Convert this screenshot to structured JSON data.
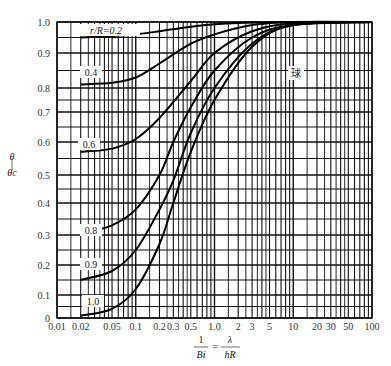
{
  "chart_data": {
    "type": "line",
    "title": "",
    "xlabel": "1/Bi = λ/(hR)",
    "xlabel_parts": {
      "left_num": "1",
      "left_den": "Bi",
      "eq": "=",
      "right_num": "λ",
      "right_den": "hR"
    },
    "ylabel": "θ/θc",
    "ylabel_parts": {
      "num": "θ",
      "den": "θc"
    },
    "xscale": "log",
    "xlim": [
      0.01,
      100
    ],
    "ylim": [
      0,
      1.0
    ],
    "grid": true,
    "x_tick_labels": [
      "0.01",
      "0.02",
      "0.05",
      "0.1",
      "0.2",
      "0.3",
      "0.5",
      "1.0",
      "2",
      "3",
      "5",
      "10",
      "20",
      "30",
      "50",
      "100"
    ],
    "x_ticks": [
      0.01,
      0.02,
      0.05,
      0.1,
      0.2,
      0.3,
      0.5,
      1.0,
      2,
      3,
      5,
      10,
      20,
      30,
      50,
      100
    ],
    "y_tick_labels": [
      "0",
      "0.1",
      "0.2",
      "0.3",
      "0.4",
      "0.5",
      "0.6",
      "0.7",
      "0.8",
      "0.9",
      "1.0"
    ],
    "y_ticks": [
      0,
      0.1,
      0.2,
      0.3,
      0.4,
      0.5,
      0.6,
      0.7,
      0.8,
      0.9,
      1.0
    ],
    "annotation": "球",
    "legend_prefix": "r/R=",
    "series": [
      {
        "name": "0.2",
        "label": "r/R=0.2",
        "x": [
          0.02,
          0.05,
          0.1,
          0.2,
          0.5,
          1,
          2,
          5,
          10
        ],
        "y": [
          0.95,
          0.955,
          0.96,
          0.97,
          0.985,
          0.993,
          0.997,
          0.999,
          1.0
        ]
      },
      {
        "name": "0.4",
        "label": "0.4",
        "x": [
          0.02,
          0.05,
          0.1,
          0.2,
          0.5,
          1,
          3,
          10
        ],
        "y": [
          0.81,
          0.815,
          0.83,
          0.87,
          0.93,
          0.96,
          0.99,
          1.0
        ]
      },
      {
        "name": "0.6",
        "label": "0.6",
        "x": [
          0.02,
          0.05,
          0.1,
          0.2,
          0.5,
          1,
          3,
          10
        ],
        "y": [
          0.57,
          0.58,
          0.61,
          0.68,
          0.82,
          0.9,
          0.97,
          0.995
        ]
      },
      {
        "name": "0.8",
        "label": "0.8",
        "x": [
          0.025,
          0.05,
          0.1,
          0.2,
          0.3,
          0.5,
          1,
          3,
          10
        ],
        "y": [
          0.31,
          0.33,
          0.38,
          0.5,
          0.6,
          0.72,
          0.85,
          0.95,
          0.99
        ]
      },
      {
        "name": "0.9",
        "label": "0.9",
        "x": [
          0.02,
          0.05,
          0.1,
          0.2,
          0.3,
          0.5,
          1,
          3,
          10
        ],
        "y": [
          0.15,
          0.18,
          0.25,
          0.38,
          0.48,
          0.63,
          0.8,
          0.93,
          0.99
        ]
      },
      {
        "name": "1.0",
        "label": "1.0",
        "x": [
          0.02,
          0.05,
          0.1,
          0.2,
          0.3,
          0.5,
          1,
          3,
          10
        ],
        "y": [
          0.01,
          0.04,
          0.12,
          0.27,
          0.4,
          0.57,
          0.75,
          0.92,
          0.99
        ]
      }
    ]
  }
}
